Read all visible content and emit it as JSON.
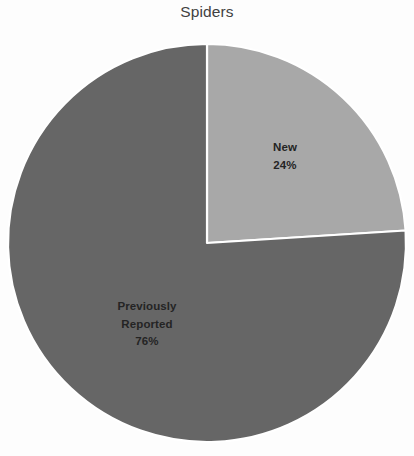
{
  "chart_data": {
    "type": "pie",
    "title": "Spiders",
    "xlabel": "",
    "ylabel": "",
    "legend_position": "none",
    "grid": false,
    "categories": [
      "New",
      "Previously Reported"
    ],
    "values": [
      24,
      76
    ],
    "unit": "%",
    "start_angle_deg": 0,
    "direction": "clockwise",
    "slices": [
      {
        "name": "New",
        "label_lines": [
          "New",
          "24%"
        ],
        "value": 24,
        "percent_text": "24%",
        "color": "#a8a8a8",
        "start_deg": 0,
        "end_deg": 86.4,
        "label_x": 285,
        "label_y": 156
      },
      {
        "name": "Previously Reported",
        "label_lines": [
          "Previously",
          "Reported",
          "76%"
        ],
        "value": 76,
        "percent_text": "76%",
        "color": "#666666",
        "start_deg": 86.4,
        "end_deg": 360,
        "label_x": 147,
        "label_y": 324
      }
    ],
    "geometry": {
      "center_x": 207,
      "center_y": 243,
      "radius": 199
    },
    "colors": {
      "background": "#fdfdfd",
      "separator": "#ffffff",
      "title_text": "#414141",
      "label_text": "#242424"
    }
  }
}
